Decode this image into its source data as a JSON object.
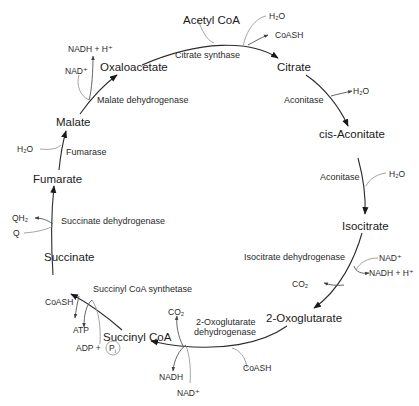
{
  "diagram": {
    "metabolites": {
      "acetyl_coa": "Acetyl CoA",
      "citrate": "Citrate",
      "cis_aconitate": "cis-Aconitate",
      "isocitrate": "Isocitrate",
      "oxoglutarate": "2-Oxoglutarate",
      "succinyl_coa": "Succinyl CoA",
      "succinate": "Succinate",
      "fumarate": "Fumarate",
      "malate": "Malate",
      "oxaloacetate": "Oxaloacetate"
    },
    "enzymes": {
      "citrate_synthase": "Citrate synthase",
      "aconitase_1": "Aconitase",
      "aconitase_2": "Aconitase",
      "isocitrate_dh": "Isocitrate dehydrogenase",
      "oxoglutarate_dh_line1": "2-Oxoglutarate",
      "oxoglutarate_dh_line2": "dehydrogenase",
      "succinyl_coa_synthetase": "Succinyl CoA synthetase",
      "succinate_dh": "Succinate dehydrogenase",
      "fumarase": "Fumarase",
      "malate_dh": "Malate dehydrogenase"
    },
    "cofactors": {
      "cs_h2o": "H₂O",
      "cs_coash": "CoASH",
      "acon1_h2o": "H₂O",
      "acon2_h2o": "H₂O",
      "idh_nad": "NAD⁺",
      "idh_nadh": "NADH + H⁺",
      "idh_co2": "CO₂",
      "ogdh_coash": "CoASH",
      "ogdh_co2": "CO₂",
      "ogdh_nadh": "NADH",
      "ogdh_nad": "NAD⁺",
      "scs_coash": "CoASH",
      "scs_atp": "ATP",
      "scs_adp": "ADP +",
      "scs_pi": "P",
      "scs_pi_sub": "i",
      "sdh_qh2": "QH₂",
      "sdh_q": "Q",
      "fum_h2o": "H₂O",
      "mdh_nad": "NAD⁺",
      "mdh_nadh": "NADH + H⁺"
    }
  }
}
